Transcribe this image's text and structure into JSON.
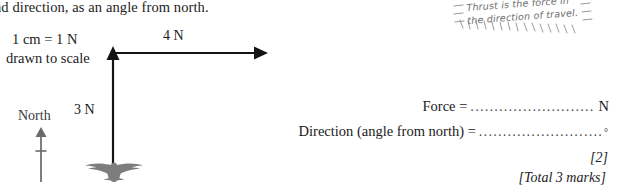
{
  "question": {
    "stem": "nd direction, as an angle from north."
  },
  "diagram": {
    "scale_key_line1": "1 cm = 1 N",
    "scale_key_line2": "drawn to scale",
    "horizontal_force_label": "4 N",
    "vertical_force_label": "3 N",
    "compass_label": "North",
    "bird_icon": "bird-silhouette-icon",
    "horizontal_arrow_icon": "right-arrow-icon",
    "vertical_arrow_icon": "up-arrow-icon",
    "compass_arrow_icon": "north-arrow-icon"
  },
  "annotation": {
    "line1": "Thrust is the force in",
    "line2": "the direction of travel.",
    "border_icon": "hatched-sticker-border-icon"
  },
  "answers": {
    "force_label": "Force =",
    "force_dots": "..........................",
    "force_unit": "N",
    "direction_label": "Direction (angle from north) =",
    "direction_dots": "..........................",
    "direction_unit": "°"
  },
  "marks": {
    "part_marks": "[2]",
    "total_marks": "[Total 3 marks]"
  },
  "colors": {
    "ink": "#1a1a1a",
    "bird": "#7d7d7d",
    "compass": "#6a6a6a",
    "handwriting": "#6d6d6d"
  }
}
